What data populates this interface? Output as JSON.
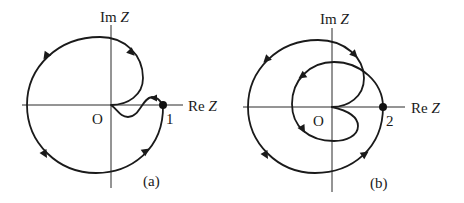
{
  "figure": {
    "type": "nyquist-diagram",
    "panels": [
      {
        "id": "a",
        "caption": "(a)",
        "x_axis_label": "Re",
        "x_axis_var": "Z",
        "y_axis_label": "Im",
        "y_axis_var": "Z",
        "origin_label": "O",
        "marked_point_label": "1",
        "marked_point_value": 1
      },
      {
        "id": "b",
        "caption": "(b)",
        "x_axis_label": "Re",
        "x_axis_var": "Z",
        "y_axis_label": "Im",
        "y_axis_var": "Z",
        "origin_label": "O",
        "marked_point_label": "2",
        "marked_point_value": 2
      }
    ],
    "colors": {
      "line": "#1a1a1a",
      "background": "#ffffff"
    }
  }
}
